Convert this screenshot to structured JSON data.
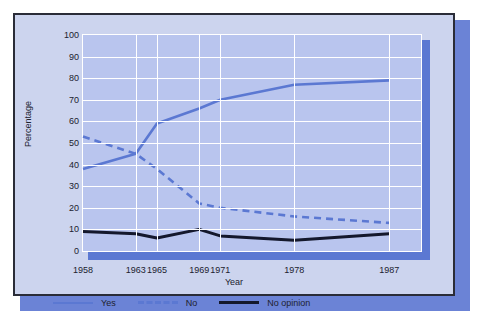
{
  "chart_data": {
    "type": "line",
    "title": "",
    "xlabel": "Year",
    "ylabel": "Percentage",
    "categories": [
      "1958",
      "1963",
      "1965",
      "1969",
      "1971",
      "1978",
      "1987"
    ],
    "x": [
      1958,
      1963,
      1965,
      1969,
      1971,
      1978,
      1987
    ],
    "ylim": [
      0,
      100
    ],
    "yticks": [
      0,
      10,
      20,
      30,
      40,
      50,
      60,
      70,
      80,
      90,
      100
    ],
    "grid": true,
    "legend_position": "bottom",
    "series": [
      {
        "name": "Yes",
        "style": "solid",
        "color": "#5b78d2",
        "values": [
          38,
          45,
          59,
          66,
          70,
          77,
          79
        ]
      },
      {
        "name": "No",
        "style": "dashed",
        "color": "#5b78d2",
        "values": [
          53,
          45,
          38,
          22,
          20,
          16,
          13
        ]
      },
      {
        "name": "No opinion",
        "style": "solid",
        "color": "#14182c",
        "values": [
          9,
          8,
          6,
          10,
          7,
          5,
          8
        ]
      }
    ]
  },
  "axis": {
    "y_label": "Percentage",
    "x_label": "Year",
    "y_ticks": [
      "100",
      "90",
      "80",
      "70",
      "60",
      "50",
      "40",
      "30",
      "20",
      "10",
      "0"
    ],
    "x_ticks": [
      "1958",
      "1963",
      "1965",
      "1969",
      "1971",
      "1978",
      "1987"
    ]
  },
  "legend": {
    "items": [
      {
        "label": "Yes",
        "style": "solid-blue"
      },
      {
        "label": "No",
        "style": "dashed-blue"
      },
      {
        "label": "No opinion",
        "style": "solid-black"
      }
    ]
  },
  "colors": {
    "page_background": "#ffffff",
    "card_background": "#ccd4ee",
    "card_border": "#2a2c38",
    "card_shadow": "#6b83d6",
    "plot_background": "#b9c5ee",
    "gridline": "#ffffff",
    "accent_blue": "#5b78d2",
    "accent_black": "#14182c",
    "text": "#20222e"
  }
}
